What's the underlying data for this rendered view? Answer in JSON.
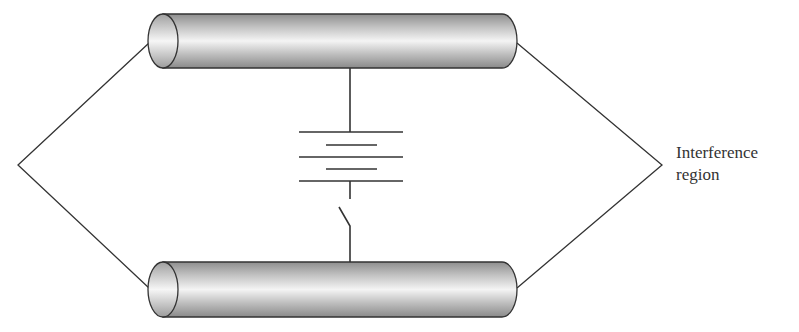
{
  "diagram": {
    "type": "circuit-schematic",
    "components": {
      "top_conductor": "cylinder",
      "bottom_conductor": "cylinder",
      "battery": "multi-cell battery",
      "switch": "open switch"
    },
    "label": {
      "line1": "Interference",
      "line2": "region"
    },
    "colors": {
      "stroke": "#333333",
      "cylinder_dark": "#9a9a9a",
      "cylinder_light": "#f2f2f2"
    }
  }
}
